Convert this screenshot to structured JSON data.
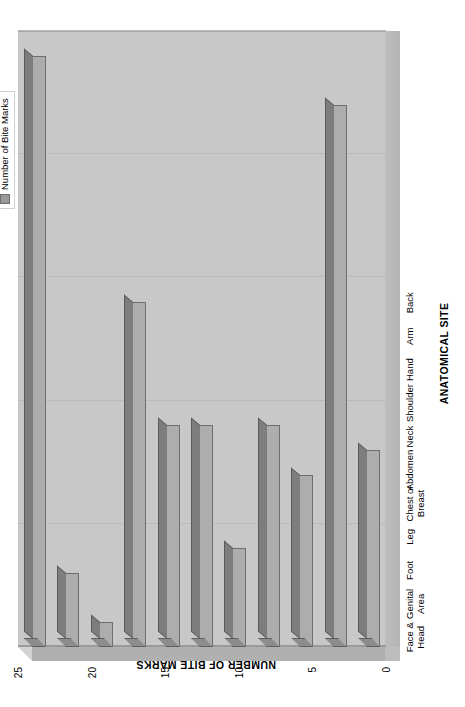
{
  "chart_data": {
    "type": "bar",
    "orientation": "vertical-3d",
    "title": "",
    "xlabel": "ANATOMICAL SITE",
    "ylabel": "NUMBER OF BITE MARKS",
    "categories": [
      "Back",
      "Arm",
      "Hand",
      "Shoulder",
      "Neck",
      "Abdomen",
      "Chest or\nBreast",
      "Leg",
      "Foot",
      "Genital\nArea",
      "Face &\nHead"
    ],
    "values": [
      8,
      22,
      7,
      9,
      4,
      9,
      9,
      14,
      1,
      3,
      24
    ],
    "series": [
      {
        "name": "Number of Bite Marks",
        "values": [
          8,
          22,
          7,
          9,
          4,
          9,
          9,
          14,
          1,
          3,
          24
        ]
      }
    ],
    "ylim": [
      0,
      25
    ],
    "ytick_values": [
      0,
      5,
      10,
      15,
      20,
      25
    ],
    "ytick_labels": [
      "0",
      "5",
      "10",
      "15",
      "20",
      "25"
    ],
    "grid": true,
    "grid_axis": "y",
    "legend": {
      "position": "top-right",
      "entries": [
        "Number of Bite Marks"
      ]
    },
    "colors": {
      "bar_face": "#adadad",
      "bar_top": "#7d7d7d",
      "bar_side": "#8c8c8c",
      "bar_edge": "#6e6e6e",
      "plot_background": "#c8c8c8",
      "floor": "#bdbdbd",
      "gridline": "#bbbbbb",
      "text": "#000000",
      "page_background": "#ffffff"
    }
  },
  "legend": {
    "label": "Number of Bite Marks",
    "swatch_color": "#999999"
  },
  "axes": {
    "x_title": "ANATOMICAL SITE",
    "y_title": "NUMBER OF BITE MARKS"
  }
}
